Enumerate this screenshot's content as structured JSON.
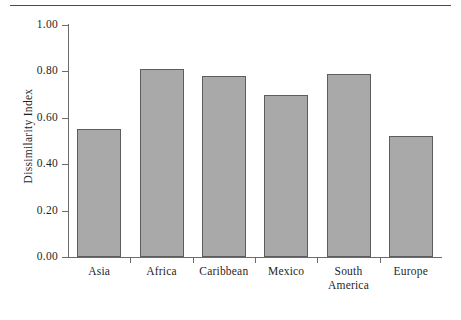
{
  "chart_data": {
    "type": "bar",
    "title": "",
    "subtitle": "",
    "xlabel": "",
    "ylabel": "Dissimilarity Index",
    "categories": [
      "Asia",
      "Africa",
      "Caribbean",
      "Mexico",
      "South America",
      "Europe"
    ],
    "category_lines": [
      [
        "Asia"
      ],
      [
        "Africa"
      ],
      [
        "Caribbean"
      ],
      [
        "Mexico"
      ],
      [
        "South",
        "America"
      ],
      [
        "Europe"
      ]
    ],
    "values": [
      0.55,
      0.81,
      0.78,
      0.7,
      0.79,
      0.52
    ],
    "ylim": [
      0.0,
      1.0
    ],
    "ytick_labels": [
      "0.00",
      "0.20",
      "0.40",
      "0.60",
      "0.80",
      "1.00"
    ],
    "ytick_values": [
      0.0,
      0.2,
      0.4,
      0.6,
      0.8,
      1.0
    ],
    "grid": false,
    "legend": "none",
    "bar_color": "#a9a9a9",
    "bar_border_color": "#5d5d5d",
    "axis_color": "#6b6b6b",
    "text_color": "#1f1f1f",
    "background_color": "#ffffff"
  }
}
